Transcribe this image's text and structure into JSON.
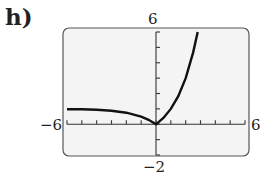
{
  "panel_label": "h)",
  "window": {
    "xmin_label": "−6",
    "xmax_label": "6",
    "ymin_label": "−2",
    "ymax_label": "6"
  },
  "chart_data": {
    "type": "line",
    "title": "h)",
    "xlabel": "",
    "ylabel": "",
    "xlim": [
      -6,
      6
    ],
    "ylim": [
      -2,
      6
    ],
    "xtick_step": 1,
    "ytick_step": 1,
    "grid": false,
    "function": "y = |2^x - 1|",
    "series": [
      {
        "name": "f(x)",
        "x": [
          -6,
          -5,
          -4,
          -3,
          -2,
          -1,
          -0.5,
          0,
          0.5,
          1,
          1.5,
          2,
          2.5,
          2.81
        ],
        "y": [
          0.98,
          0.97,
          0.94,
          0.88,
          0.75,
          0.5,
          0.29,
          0,
          0.41,
          1,
          1.83,
          3,
          4.66,
          6
        ]
      }
    ],
    "colors": {
      "curve": "#111111",
      "frame": "#555555",
      "background": "#f4f4f4"
    }
  }
}
